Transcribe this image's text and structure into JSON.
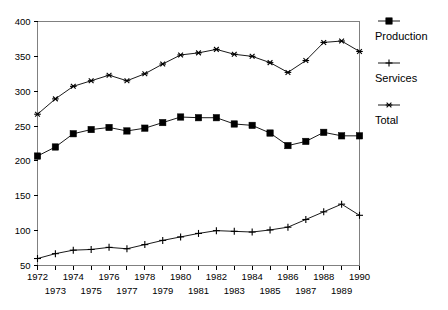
{
  "chart_data": {
    "type": "line",
    "title": "",
    "subtitle": "",
    "xlabel": "",
    "ylabel": "",
    "x": [
      1972,
      1973,
      1974,
      1975,
      1976,
      1977,
      1978,
      1979,
      1980,
      1981,
      1982,
      1983,
      1984,
      1985,
      1986,
      1987,
      1988,
      1989,
      1990
    ],
    "xtick_labels_top": [
      "1972",
      "1974",
      "1976",
      "1978",
      "1980",
      "1982",
      "1984",
      "1986",
      "1988",
      "1990"
    ],
    "xtick_labels_bottom": [
      "1973",
      "1975",
      "1977",
      "1979",
      "1981",
      "1983",
      "1985",
      "1987",
      "1989"
    ],
    "xlim": [
      1972,
      1990
    ],
    "ylim": [
      50,
      400
    ],
    "ytick_labels": [
      "400",
      "350",
      "300",
      "250",
      "200",
      "150",
      "100",
      "50"
    ],
    "yticks": [
      400,
      350,
      300,
      250,
      200,
      150,
      100,
      50
    ],
    "grid": false,
    "legend_position": "right",
    "series": [
      {
        "name": "Production",
        "marker": "filled-square",
        "values": [
          207,
          220,
          239,
          245,
          248,
          243,
          247,
          255,
          263,
          262,
          262,
          253,
          251,
          240,
          222,
          228,
          241,
          236,
          236
        ]
      },
      {
        "name": "Services",
        "marker": "plus",
        "values": [
          60,
          67,
          72,
          73,
          76,
          74,
          80,
          86,
          91,
          96,
          100,
          99,
          98,
          101,
          105,
          116,
          127,
          138,
          122
        ]
      },
      {
        "name": "Total",
        "marker": "asterisk",
        "values": [
          267,
          289,
          307,
          315,
          323,
          315,
          325,
          339,
          352,
          355,
          360,
          353,
          350,
          341,
          327,
          344,
          370,
          372,
          357
        ]
      }
    ]
  },
  "legend": {
    "items": [
      {
        "label": "Production",
        "marker": "filled-square"
      },
      {
        "label": "Services",
        "marker": "plus"
      },
      {
        "label": "Total",
        "marker": "asterisk"
      }
    ]
  }
}
